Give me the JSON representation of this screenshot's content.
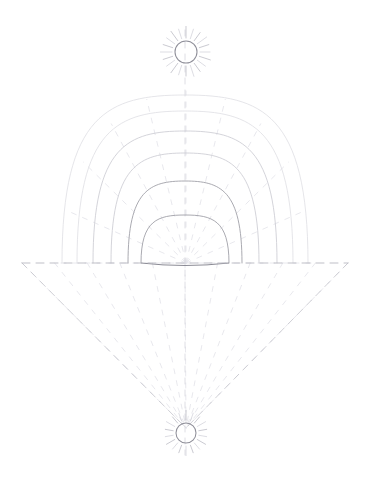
{
  "figure": {
    "background_color": "#ffffff",
    "width": 370,
    "height": 485,
    "style": "faint pencil line drawing",
    "colors": {
      "solid_stroke": "#9b9ba3",
      "faint_stroke": "#c9c9d0",
      "fainter_stroke": "#dcdce1",
      "dashed_stroke": "#c4c4cc",
      "sun_stroke": "#8f8f99",
      "background": "#ffffff"
    }
  },
  "axis": {
    "center_x": 185,
    "horizon_y": 263,
    "horizon_x_start": 22,
    "horizon_x_end": 348,
    "vertical_top_y": 30,
    "vertical_bottom_y": 455
  },
  "top_sun": {
    "label": "upper sun",
    "center_x": 186,
    "center_y": 52,
    "radius": 11,
    "ray_count": 20,
    "ray_inner": 14,
    "ray_outer": 24
  },
  "bottom_sun": {
    "label": "lower sun",
    "center_x": 186,
    "center_y": 433,
    "radius": 10,
    "ray_count": 18,
    "ray_inner": 13,
    "ray_outer": 21
  },
  "domes": {
    "label": "nested dome curves",
    "count": 6,
    "base_y": 263,
    "items": [
      {
        "half_width": 123,
        "height": 168,
        "weight": "fainter"
      },
      {
        "half_width": 108,
        "height": 152,
        "weight": "fainter"
      },
      {
        "half_width": 92,
        "height": 132,
        "weight": "faint"
      },
      {
        "half_width": 74,
        "height": 110,
        "weight": "faint"
      },
      {
        "half_width": 57,
        "height": 82,
        "weight": "solid"
      },
      {
        "half_width": 44,
        "height": 48,
        "weight": "solid"
      }
    ]
  },
  "cone": {
    "label": "inverted dashed cone",
    "apex_x": 186,
    "apex_y": 428,
    "left_x": 22,
    "right_x": 348,
    "top_y": 263,
    "radial_count": 11
  },
  "upper_radials": {
    "label": "upper dashed radial lines",
    "count": 11,
    "origin_x": 186,
    "origin_y": 263
  }
}
